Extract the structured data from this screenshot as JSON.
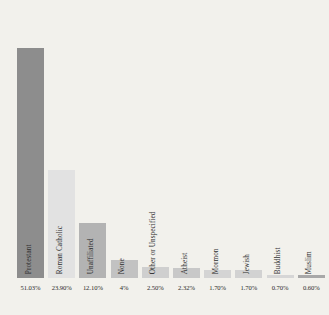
{
  "chart_data": {
    "type": "bar",
    "title": "",
    "subtitle": "",
    "xlabel": "",
    "ylabel": "",
    "grid": false,
    "legend": false,
    "ylim": [
      0,
      55
    ],
    "categories": [
      "Protestant",
      "Roman Catholic",
      "Unaffiliated",
      "None",
      "Other or Unspecified",
      "Atheist",
      "Mormon",
      "Jewish",
      "Buddhist",
      "Muslim"
    ],
    "values": [
      51.03,
      23.9,
      12.1,
      4,
      2.5,
      2.32,
      1.7,
      1.7,
      0.7,
      0.6
    ],
    "value_labels": [
      "51.03%",
      "23.90%",
      "12.10%",
      "4%",
      "2.50%",
      "2.32%",
      "1.70%",
      "1.70%",
      "0.70%",
      "0.60%"
    ],
    "bar_colors": [
      "#8d8d8d",
      "#e2e2e2",
      "#b3b3b3",
      "#c2c2c2",
      "#cfcfcf",
      "#c8c8c8",
      "#d4d4d4",
      "#d2d2d2",
      "#d6d6d6",
      "#a8a8a8"
    ],
    "background_color": "#f2f1ec",
    "label_color": "#2e2e2e"
  }
}
